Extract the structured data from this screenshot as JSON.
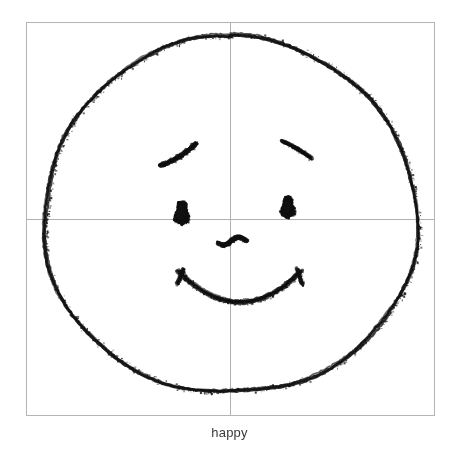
{
  "figure": {
    "caption": "happy",
    "background_color": "#ffffff",
    "frame": {
      "name": "plot-frame",
      "x": 26,
      "y": 22,
      "width": 408,
      "height": 393,
      "stroke_color": "#b4b4b4",
      "stroke_width": 1
    },
    "crosshair": {
      "name": "center-crosshair",
      "vertical_x": 230,
      "horizontal_y": 219,
      "stroke_color": "#b0b0b0",
      "stroke_width": 1
    },
    "drawing": {
      "type": "hand-drawn-sketch",
      "subject": "smiley-face",
      "ink_color": "#111111",
      "face_outline": {
        "name": "face-outline",
        "center_x": 231,
        "center_y": 216,
        "radius_x": 187,
        "radius_y": 178,
        "stroke_width": 3
      },
      "left_eye": {
        "name": "left-eye",
        "center_x": 181,
        "center_y": 213,
        "width": 13,
        "height": 23
      },
      "right_eye": {
        "name": "right-eye",
        "center_x": 287,
        "center_y": 207,
        "width": 12,
        "height": 21
      },
      "left_eyebrow": {
        "name": "left-eyebrow",
        "start_x": 160,
        "start_y": 165,
        "end_x": 196,
        "end_y": 143
      },
      "right_eyebrow": {
        "name": "right-eyebrow",
        "start_x": 282,
        "start_y": 141,
        "end_x": 311,
        "end_y": 158
      },
      "nose": {
        "name": "nose",
        "start_x": 218,
        "start_y": 244,
        "end_x": 247,
        "end_y": 240
      },
      "mouth": {
        "name": "smiling-mouth",
        "left_x": 178,
        "left_y": 271,
        "right_x": 301,
        "right_y": 271,
        "bottom_x": 240,
        "bottom_y": 309
      }
    }
  }
}
